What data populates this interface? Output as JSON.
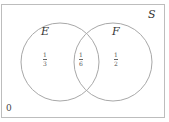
{
  "diagram": {
    "type": "venn",
    "universe_label": "S",
    "sets": [
      {
        "label": "E",
        "region_value": {
          "numerator": "1",
          "denominator": "3"
        }
      },
      {
        "label": "F",
        "region_value": {
          "numerator": "1",
          "denominator": "2"
        }
      }
    ],
    "intersection_value": {
      "numerator": "1",
      "denominator": "6"
    },
    "outside_value": "0",
    "colors": {
      "circle_stroke": "#a8a8a8",
      "frame_border": "#bdbdbd",
      "text": "#333333"
    }
  }
}
